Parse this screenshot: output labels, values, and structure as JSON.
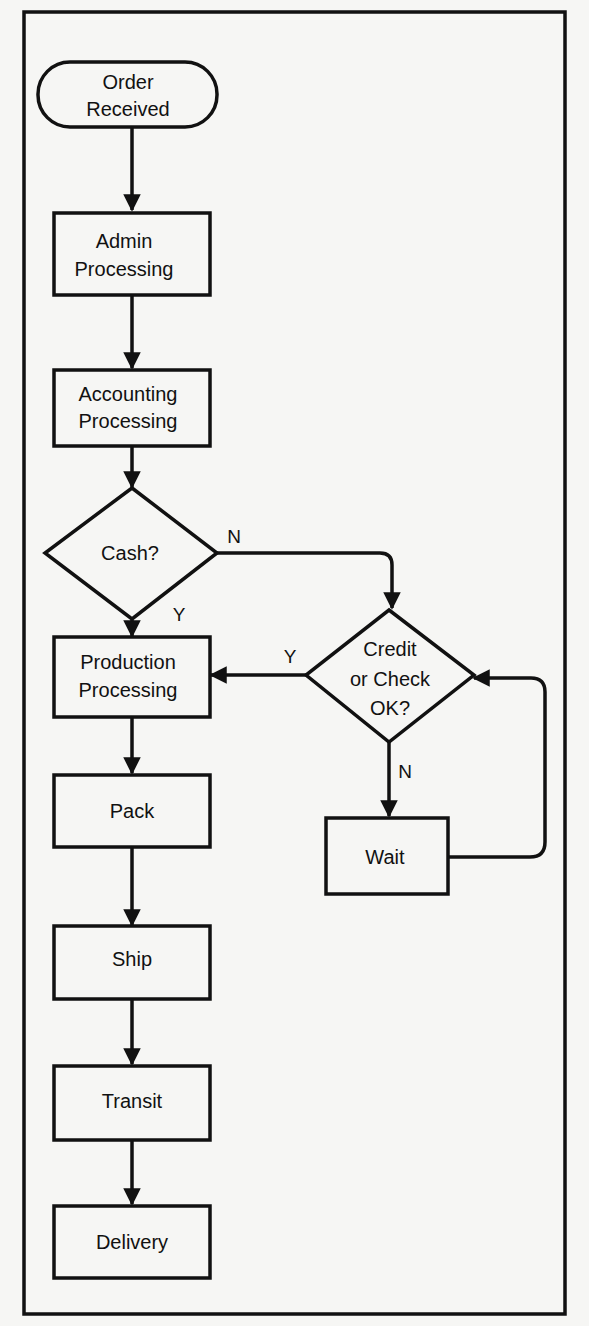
{
  "diagram": {
    "type": "flowchart",
    "colors": {
      "background": "#f6f6f4",
      "ink": "#111111"
    },
    "nodes": {
      "order_received": {
        "shape": "terminator",
        "line1": "Order",
        "line2": "Received"
      },
      "admin": {
        "shape": "process",
        "line1": "Admin",
        "line2": "Processing"
      },
      "accounting": {
        "shape": "process",
        "line1": "Accounting",
        "line2": "Processing"
      },
      "cash": {
        "shape": "decision",
        "line1": "Cash?"
      },
      "credit": {
        "shape": "decision",
        "line1": "Credit",
        "line2": "or Check",
        "line3": "OK?"
      },
      "production": {
        "shape": "process",
        "line1": "Production",
        "line2": "Processing"
      },
      "wait": {
        "shape": "process",
        "line1": "Wait"
      },
      "pack": {
        "shape": "process",
        "line1": "Pack"
      },
      "ship": {
        "shape": "process",
        "line1": "Ship"
      },
      "transit": {
        "shape": "process",
        "line1": "Transit"
      },
      "delivery": {
        "shape": "process",
        "line1": "Delivery"
      }
    },
    "edge_labels": {
      "cash_no": "N",
      "cash_yes": "Y",
      "credit_yes": "Y",
      "credit_no": "N"
    },
    "edges": [
      {
        "from": "order_received",
        "to": "admin"
      },
      {
        "from": "admin",
        "to": "accounting"
      },
      {
        "from": "accounting",
        "to": "cash"
      },
      {
        "from": "cash",
        "to": "production",
        "label": "Y"
      },
      {
        "from": "cash",
        "to": "credit",
        "label": "N"
      },
      {
        "from": "credit",
        "to": "production",
        "label": "Y"
      },
      {
        "from": "credit",
        "to": "wait",
        "label": "N"
      },
      {
        "from": "wait",
        "to": "credit"
      },
      {
        "from": "production",
        "to": "pack"
      },
      {
        "from": "pack",
        "to": "ship"
      },
      {
        "from": "ship",
        "to": "transit"
      },
      {
        "from": "transit",
        "to": "delivery"
      }
    ]
  }
}
